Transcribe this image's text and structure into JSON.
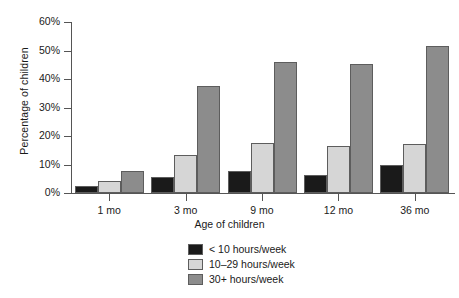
{
  "chart_data": {
    "type": "bar",
    "title": "",
    "subtitle": "",
    "xlabel": "Age of children",
    "ylabel": "Percentage of children",
    "categories": [
      "1 mo",
      "3 mo",
      "9 mo",
      "12 mo",
      "36 mo"
    ],
    "series": [
      {
        "name": "< 10 hours/week",
        "color": "#1a1a1a",
        "values": [
          2.3,
          5.6,
          7.6,
          6.4,
          10.0
        ]
      },
      {
        "name": "10–29 hours/week",
        "color": "#d6d6d6",
        "values": [
          4.2,
          13.4,
          17.6,
          16.4,
          17.1
        ]
      },
      {
        "name": "30+ hours/week",
        "color": "#8c8c8c",
        "values": [
          7.7,
          37.6,
          46.1,
          45.2,
          51.5
        ]
      }
    ],
    "ylim": [
      0,
      60
    ],
    "ytick_values": [
      0,
      10,
      20,
      30,
      40,
      50,
      60
    ],
    "ytick_labels": [
      "0%",
      "10%",
      "20%",
      "30%",
      "40%",
      "50%",
      "60%"
    ],
    "grid": false,
    "legend_position": "bottom-center",
    "axis_color": "#555555",
    "background": "#ffffff"
  }
}
